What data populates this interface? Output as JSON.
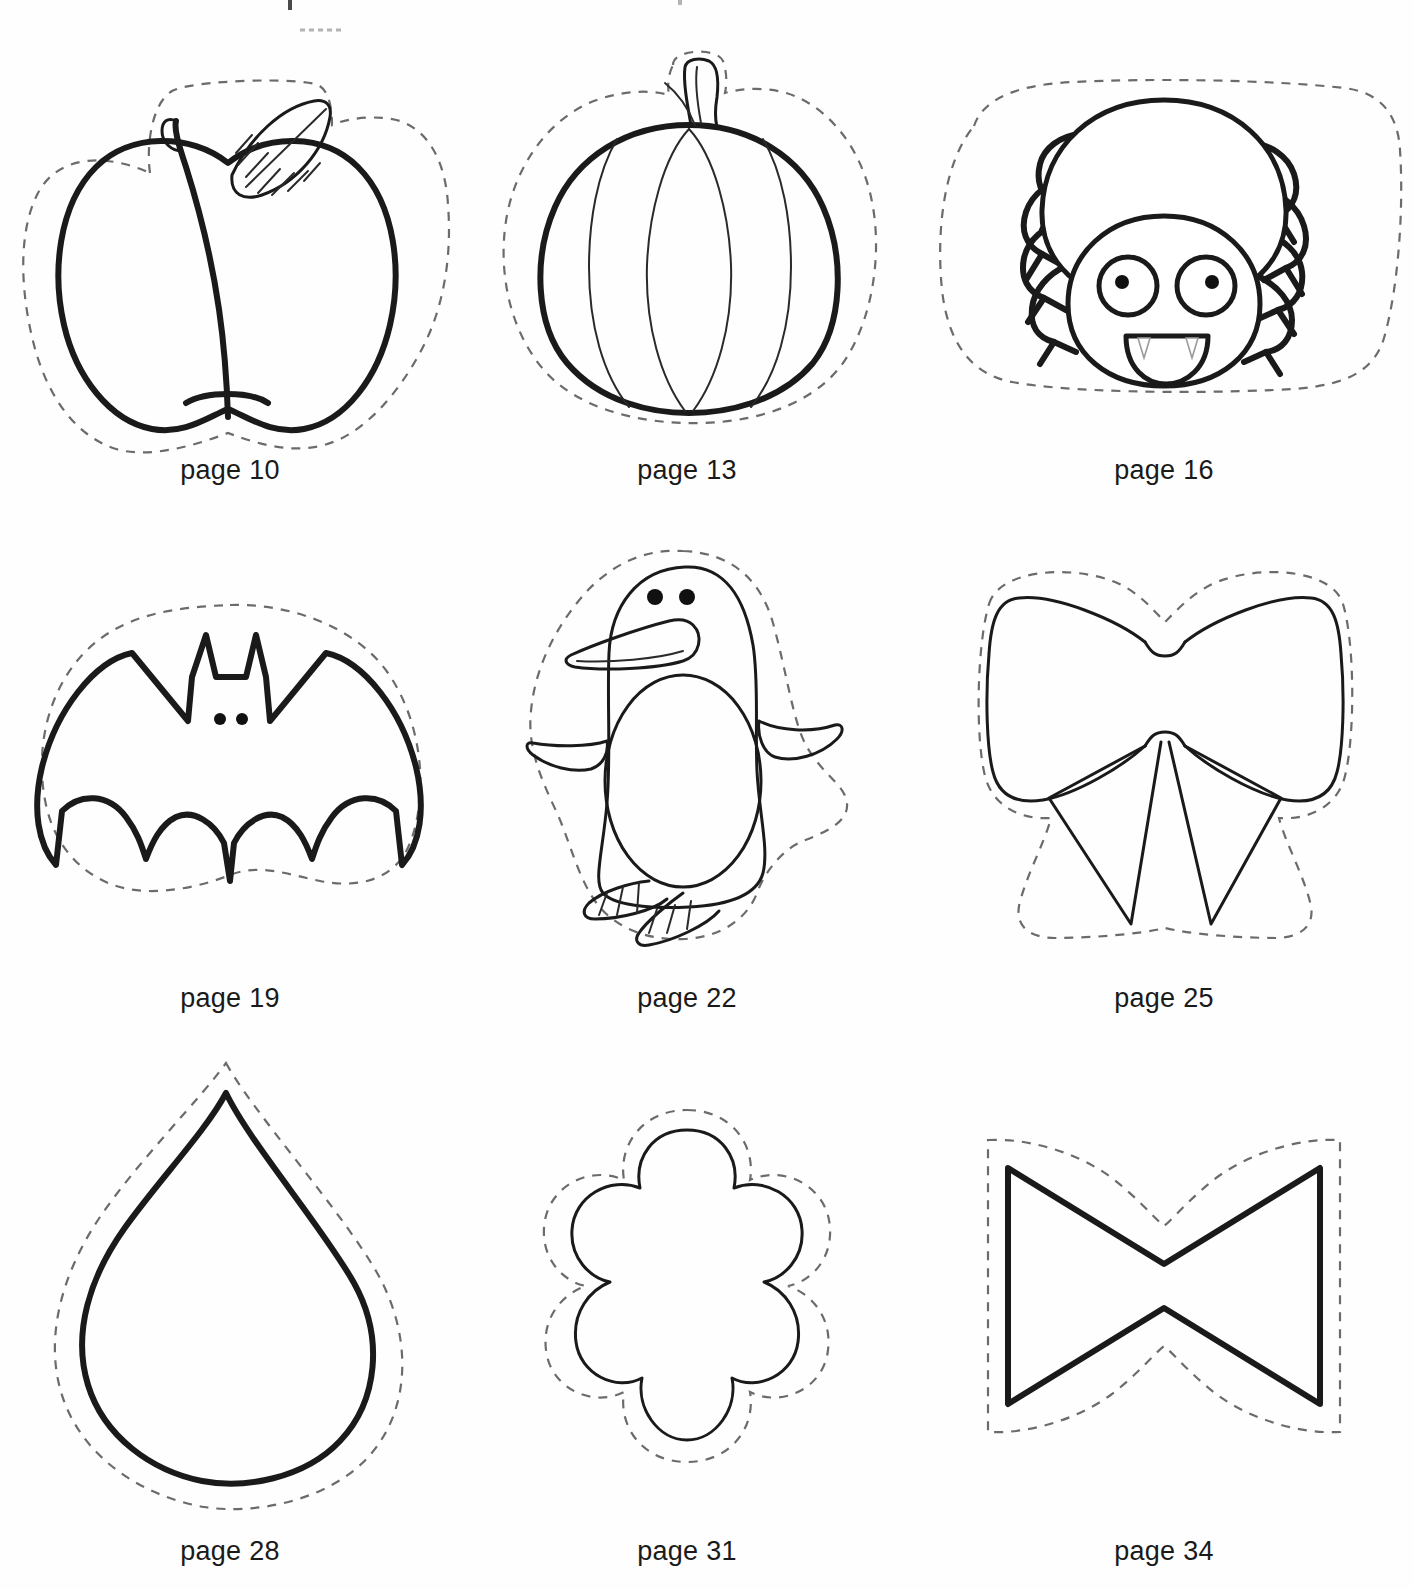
{
  "document": {
    "type": "craft-template-sheet",
    "background_color": "#fefefe",
    "ink_color": "#1a1a1a",
    "cut_line_color": "#6b6b6b"
  },
  "templates": [
    {
      "shape_name": "apple",
      "icon": "apple-icon",
      "caption": "page 10"
    },
    {
      "shape_name": "pumpkin",
      "icon": "pumpkin-icon",
      "caption": "page 13"
    },
    {
      "shape_name": "spider",
      "icon": "spider-icon",
      "caption": "page 16"
    },
    {
      "shape_name": "bat",
      "icon": "bat-icon",
      "caption": "page 19"
    },
    {
      "shape_name": "penguin",
      "icon": "penguin-icon",
      "caption": "page 22"
    },
    {
      "shape_name": "bow",
      "icon": "bow-icon",
      "caption": "page 25"
    },
    {
      "shape_name": "teardrop",
      "icon": "teardrop-icon",
      "caption": "page 28"
    },
    {
      "shape_name": "flower",
      "icon": "flower-icon",
      "caption": "page 31"
    },
    {
      "shape_name": "bowtie",
      "icon": "bowtie-icon",
      "caption": "page 34"
    }
  ]
}
